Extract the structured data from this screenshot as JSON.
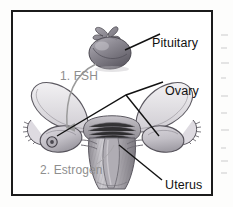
{
  "figure": {
    "type": "anatomical-diagram",
    "style": "grayscale-line-drawing",
    "frame": {
      "border_color": "#1b1b1b",
      "background_color": "#ffffff"
    },
    "labels": [
      {
        "id": "pituitary",
        "text": "Pituitary",
        "color": "#111111",
        "style": "black",
        "points_to": "pituitary-gland"
      },
      {
        "id": "ovary",
        "text": "Ovary",
        "color": "#111111",
        "style": "black",
        "points_to": "both-ovaries"
      },
      {
        "id": "uterus",
        "text": "Uterus",
        "color": "#111111",
        "style": "black",
        "points_to": "uterus-body"
      },
      {
        "id": "fsh",
        "text": "1. FSH",
        "color": "#8e8e8e",
        "style": "gray",
        "points_to": "left-ovary"
      },
      {
        "id": "estrogen",
        "text": "2. Estrogen",
        "color": "#8e8e8e",
        "style": "gray",
        "points_to": "uterus-endometrium"
      }
    ],
    "structures": [
      {
        "id": "pituitary-gland",
        "name": "Pituitary gland",
        "fill": "#8c8a92"
      },
      {
        "id": "left-ovary",
        "name": "Left ovary",
        "fill": "#c9c6cc",
        "detail": "follicle"
      },
      {
        "id": "right-ovary",
        "name": "Right ovary",
        "fill": "#c9c6cc"
      },
      {
        "id": "left-fallopian-tube",
        "name": "Left fallopian tube",
        "fill": "#e2e0e3"
      },
      {
        "id": "right-fallopian-tube",
        "name": "Right fallopian tube",
        "fill": "#e2e0e3"
      },
      {
        "id": "uterus-body",
        "name": "Uterus",
        "fill": "#b9b6bb"
      },
      {
        "id": "endometrium",
        "name": "Endometrium lining",
        "fill": "#9d9aa0"
      }
    ],
    "arrows": [
      {
        "id": "fsh-arrow",
        "from": "pituitary-gland",
        "to": "left-ovary",
        "color": "#9b9b9b",
        "shape": "curved"
      }
    ]
  }
}
